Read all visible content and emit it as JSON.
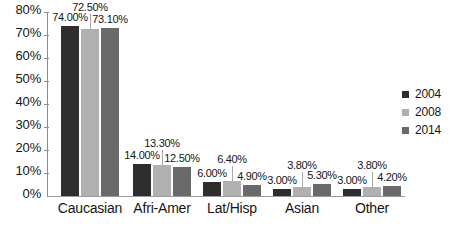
{
  "chart_data": {
    "type": "bar",
    "title": "",
    "xlabel": "",
    "ylabel": "",
    "categories": [
      "Caucasian",
      "Afri-Amer",
      "Lat/Hisp",
      "Asian",
      "Other"
    ],
    "series": [
      {
        "name": "2004",
        "color": "#2e2e2e",
        "values": [
          74.0,
          14.0,
          6.0,
          3.0,
          3.0
        ],
        "labels": [
          "74.00%",
          "14.00%",
          "6.00%",
          "3.00%",
          "3.00%"
        ]
      },
      {
        "name": "2008",
        "color": "#b0b0b0",
        "values": [
          72.5,
          13.3,
          6.4,
          3.8,
          3.8
        ],
        "labels": [
          "72.50%",
          "13.30%",
          "6.40%",
          "3.80%",
          "3.80%"
        ]
      },
      {
        "name": "2014",
        "color": "#6a6a6a",
        "values": [
          73.1,
          12.5,
          4.9,
          5.3,
          4.2
        ],
        "labels": [
          "73.10%",
          "12.50%",
          "4.90%",
          "5.30%",
          "4.20%"
        ]
      }
    ],
    "ylim": [
      0,
      80
    ],
    "ytick_values": [
      80,
      70,
      60,
      50,
      40,
      30,
      20,
      10,
      0
    ],
    "ytick_labels": [
      "80%",
      "70%",
      "60%",
      "50%",
      "40%",
      "30%",
      "20%",
      "10%",
      "0%"
    ],
    "grid": false,
    "legend_position": "right",
    "legend_entries": [
      "2004",
      "2008",
      "2014"
    ]
  },
  "axis": {
    "y": {
      "ticks": [
        {
          "label": "80%",
          "value": 80
        },
        {
          "label": "70%",
          "value": 70
        },
        {
          "label": "60%",
          "value": 60
        },
        {
          "label": "50%",
          "value": 50
        },
        {
          "label": "40%",
          "value": 40
        },
        {
          "label": "30%",
          "value": 30
        },
        {
          "label": "20%",
          "value": 20
        },
        {
          "label": "10%",
          "value": 10
        },
        {
          "label": "0%",
          "value": 0
        }
      ]
    },
    "x": {
      "categories": [
        {
          "label": "Caucasian"
        },
        {
          "label": "Afri-Amer"
        },
        {
          "label": "Lat/Hisp"
        },
        {
          "label": "Asian"
        },
        {
          "label": "Other"
        }
      ]
    }
  },
  "legend": {
    "items": [
      {
        "label": "2004",
        "color": "#2e2e2e"
      },
      {
        "label": "2008",
        "color": "#b0b0b0"
      },
      {
        "label": "2014",
        "color": "#6a6a6a"
      }
    ]
  },
  "groups": [
    {
      "category": "Caucasian",
      "bars": [
        {
          "series": "2004",
          "label": "74.00%",
          "value": 74.0
        },
        {
          "series": "2008",
          "label": "72.50%",
          "value": 72.5
        },
        {
          "series": "2014",
          "label": "73.10%",
          "value": 73.1
        }
      ]
    },
    {
      "category": "Afri-Amer",
      "bars": [
        {
          "series": "2004",
          "label": "14.00%",
          "value": 14.0
        },
        {
          "series": "2008",
          "label": "13.30%",
          "value": 13.3
        },
        {
          "series": "2014",
          "label": "12.50%",
          "value": 12.5
        }
      ]
    },
    {
      "category": "Lat/Hisp",
      "bars": [
        {
          "series": "2004",
          "label": "6.00%",
          "value": 6.0
        },
        {
          "series": "2008",
          "label": "6.40%",
          "value": 6.4
        },
        {
          "series": "2014",
          "label": "4.90%",
          "value": 4.9
        }
      ]
    },
    {
      "category": "Asian",
      "bars": [
        {
          "series": "2004",
          "label": "3.00%",
          "value": 3.0
        },
        {
          "series": "2008",
          "label": "3.80%",
          "value": 3.8
        },
        {
          "series": "2014",
          "label": "5.30%",
          "value": 5.3
        }
      ]
    },
    {
      "category": "Other",
      "bars": [
        {
          "series": "2004",
          "label": "3.00%",
          "value": 3.0
        },
        {
          "series": "2008",
          "label": "3.80%",
          "value": 3.8
        },
        {
          "series": "2014",
          "label": "4.20%",
          "value": 4.2
        }
      ]
    }
  ]
}
